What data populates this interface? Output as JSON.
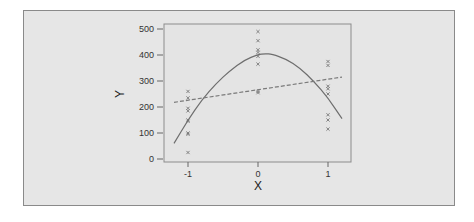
{
  "chart_data": {
    "type": "scatter",
    "title": "",
    "xlabel": "X",
    "ylabel": "Y",
    "xlim": [
      -1.3,
      1.3
    ],
    "ylim": [
      -10,
      510
    ],
    "x_ticks": [
      -1,
      0,
      1
    ],
    "x_tick_labels": [
      "-1",
      "0",
      "1"
    ],
    "y_ticks": [
      0,
      100,
      200,
      300,
      400,
      500
    ],
    "y_tick_labels": [
      "0",
      "100",
      "200",
      "300",
      "400",
      "500"
    ],
    "grid": false,
    "legend": null,
    "series": [
      {
        "name": "observations",
        "kind": "scatter",
        "marker": "x",
        "points": [
          {
            "x": -1,
            "y": 260
          },
          {
            "x": -1,
            "y": 235
          },
          {
            "x": -1,
            "y": 195
          },
          {
            "x": -1,
            "y": 185
          },
          {
            "x": -1,
            "y": 150
          },
          {
            "x": -1,
            "y": 145
          },
          {
            "x": -1,
            "y": 100
          },
          {
            "x": -1,
            "y": 95
          },
          {
            "x": -1,
            "y": 25
          },
          {
            "x": 0,
            "y": 490
          },
          {
            "x": 0,
            "y": 455
          },
          {
            "x": 0,
            "y": 420
          },
          {
            "x": 0,
            "y": 410
          },
          {
            "x": 0,
            "y": 395
          },
          {
            "x": 0,
            "y": 365
          },
          {
            "x": 0,
            "y": 260
          },
          {
            "x": 0,
            "y": 255
          },
          {
            "x": 1,
            "y": 375
          },
          {
            "x": 1,
            "y": 360
          },
          {
            "x": 1,
            "y": 280
          },
          {
            "x": 1,
            "y": 270
          },
          {
            "x": 1,
            "y": 250
          },
          {
            "x": 1,
            "y": 170
          },
          {
            "x": 1,
            "y": 150
          },
          {
            "x": 1,
            "y": 115
          }
        ]
      },
      {
        "name": "quadratic fit",
        "kind": "line",
        "style": "solid",
        "x": [
          -1.2,
          -1.0,
          -0.8,
          -0.6,
          -0.4,
          -0.2,
          0.0,
          0.1,
          0.2,
          0.4,
          0.6,
          0.8,
          1.0,
          1.2
        ],
        "y": [
          60,
          150,
          228,
          290,
          340,
          380,
          402,
          405,
          403,
          385,
          350,
          298,
          235,
          155
        ]
      },
      {
        "name": "linear fit",
        "kind": "line",
        "style": "dashed",
        "x": [
          -1.2,
          1.2
        ],
        "y": [
          218,
          315
        ]
      }
    ]
  }
}
